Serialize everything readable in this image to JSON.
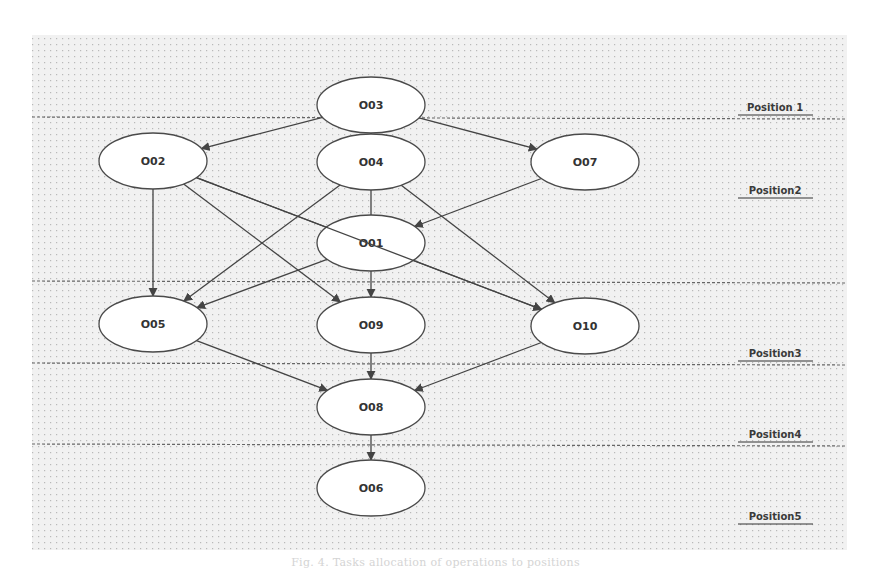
{
  "diagram": {
    "colors": {
      "background": "#ffffff",
      "grid_area": "#f1f1f1",
      "grid_dot": "#bdbdbd",
      "node_fill": "#ffffff",
      "node_stroke": "#4a4a4a",
      "edge": "#444444",
      "separator": "#666666",
      "label_text": "#333333"
    },
    "nodes": [
      {
        "id": "O03",
        "label": "O03",
        "cx": 371,
        "cy": 105
      },
      {
        "id": "O02",
        "label": "O02",
        "cx": 153,
        "cy": 161
      },
      {
        "id": "O04",
        "label": "O04",
        "cx": 371,
        "cy": 162
      },
      {
        "id": "O07",
        "label": "O07",
        "cx": 585,
        "cy": 162
      },
      {
        "id": "O01",
        "label": "O01",
        "cx": 371,
        "cy": 243
      },
      {
        "id": "O05",
        "label": "O05",
        "cx": 153,
        "cy": 324
      },
      {
        "id": "O09",
        "label": "O09",
        "cx": 371,
        "cy": 325
      },
      {
        "id": "O10",
        "label": "O10",
        "cx": 585,
        "cy": 326
      },
      {
        "id": "O08",
        "label": "O08",
        "cx": 371,
        "cy": 407
      },
      {
        "id": "O06",
        "label": "O06",
        "cx": 371,
        "cy": 488
      }
    ],
    "edges": [
      {
        "from": "O03",
        "to": "O02"
      },
      {
        "from": "O03",
        "to": "O04"
      },
      {
        "from": "O03",
        "to": "O07"
      },
      {
        "from": "O02",
        "to": "O05"
      },
      {
        "from": "O02",
        "to": "O09"
      },
      {
        "from": "O02",
        "to": "O10"
      },
      {
        "from": "O04",
        "to": "O05"
      },
      {
        "from": "O04",
        "to": "O09"
      },
      {
        "from": "O04",
        "to": "O10"
      },
      {
        "from": "O07",
        "to": "O01"
      },
      {
        "from": "O01",
        "to": "O05"
      },
      {
        "from": "O05",
        "to": "O08"
      },
      {
        "from": "O09",
        "to": "O08"
      },
      {
        "from": "O10",
        "to": "O08"
      },
      {
        "from": "O08",
        "to": "O06"
      }
    ],
    "positions": [
      {
        "label": "Position 1",
        "label_y": 111,
        "separator_y": 117
      },
      {
        "label": "Position2",
        "label_y": 194,
        "separator_y": 281
      },
      {
        "label": "Position3",
        "label_y": 357,
        "separator_y": 363
      },
      {
        "label": "Position4",
        "label_y": 438,
        "separator_y": 444
      },
      {
        "label": "Position5",
        "label_y": 520,
        "separator_y": null
      }
    ]
  },
  "caption": "Fig. 4. Tasks allocation of operations to positions"
}
